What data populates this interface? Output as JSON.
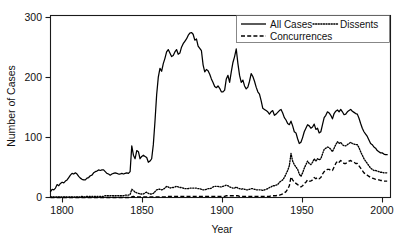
{
  "chart_data": {
    "type": "line",
    "title": "",
    "xlabel": "Year",
    "ylabel": "Number of Cases",
    "xlim": [
      1800,
      2005
    ],
    "ylim": [
      0,
      310
    ],
    "xticks": [
      1800,
      1850,
      1900,
      1950,
      2000
    ],
    "yticks": [
      0,
      100,
      200,
      300
    ],
    "grid": false,
    "legend_position": "top-right",
    "legend_entries": [
      "All Cases",
      "Dissents",
      "Concurrences"
    ],
    "x": [
      1800,
      1801,
      1802,
      1803,
      1804,
      1805,
      1806,
      1807,
      1808,
      1809,
      1810,
      1811,
      1812,
      1813,
      1814,
      1815,
      1816,
      1817,
      1818,
      1819,
      1820,
      1821,
      1822,
      1823,
      1824,
      1825,
      1826,
      1827,
      1828,
      1829,
      1830,
      1831,
      1832,
      1833,
      1834,
      1835,
      1836,
      1837,
      1838,
      1839,
      1840,
      1841,
      1842,
      1843,
      1844,
      1845,
      1846,
      1847,
      1848,
      1849,
      1850,
      1851,
      1852,
      1853,
      1854,
      1855,
      1856,
      1857,
      1858,
      1859,
      1860,
      1861,
      1862,
      1863,
      1864,
      1865,
      1866,
      1867,
      1868,
      1869,
      1870,
      1871,
      1872,
      1873,
      1874,
      1875,
      1876,
      1877,
      1878,
      1879,
      1880,
      1881,
      1882,
      1883,
      1884,
      1885,
      1886,
      1887,
      1888,
      1889,
      1890,
      1891,
      1892,
      1893,
      1894,
      1895,
      1896,
      1897,
      1898,
      1899,
      1900,
      1901,
      1902,
      1903,
      1904,
      1905,
      1906,
      1907,
      1908,
      1909,
      1910,
      1911,
      1912,
      1913,
      1914,
      1915,
      1916,
      1917,
      1918,
      1919,
      1920,
      1921,
      1922,
      1923,
      1924,
      1925,
      1926,
      1927,
      1928,
      1929,
      1930,
      1931,
      1932,
      1933,
      1934,
      1935,
      1936,
      1937,
      1938,
      1939,
      1940,
      1941,
      1942,
      1943,
      1944,
      1945,
      1946,
      1947,
      1948,
      1949,
      1950,
      1951,
      1952,
      1953,
      1954,
      1955,
      1956,
      1957,
      1958,
      1959,
      1960,
      1961,
      1962,
      1963,
      1964,
      1965,
      1966,
      1967,
      1968,
      1969,
      1970,
      1971,
      1972,
      1973,
      1974,
      1975,
      1976,
      1977,
      1978,
      1979,
      1980,
      1981,
      1982,
      1983,
      1984,
      1985,
      1986,
      1987,
      1988,
      1989,
      1990,
      1991,
      1992,
      1993,
      1994,
      1995,
      1996,
      1997,
      1998,
      1999,
      2000,
      2001,
      2002,
      2003
    ],
    "series": [
      {
        "name": "All Cases",
        "style": "solid",
        "values": [
          10,
          14,
          13,
          16,
          22,
          20,
          24,
          26,
          25,
          28,
          30,
          34,
          38,
          41,
          40,
          42,
          40,
          36,
          33,
          31,
          30,
          30,
          33,
          34,
          37,
          38,
          42,
          44,
          45,
          47,
          46,
          47,
          47,
          44,
          41,
          40,
          38,
          40,
          41,
          42,
          41,
          40,
          40,
          41,
          40,
          41,
          42,
          41,
          44,
          88,
          72,
          66,
          80,
          78,
          66,
          70,
          72,
          70,
          68,
          60,
          62,
          66,
          90,
          130,
          175,
          205,
          220,
          215,
          228,
          237,
          248,
          252,
          246,
          240,
          242,
          248,
          252,
          244,
          246,
          256,
          262,
          266,
          270,
          276,
          280,
          281,
          278,
          268,
          270,
          258,
          254,
          250,
          226,
          214,
          218,
          216,
          210,
          202,
          196,
          189,
          187,
          190,
          186,
          180,
          180,
          183,
          202,
          208,
          196,
          214,
          230,
          240,
          253,
          228,
          208,
          196,
          200,
          190,
          185,
          188,
          198,
          211,
          206,
          198,
          188,
          180,
          176,
          165,
          152,
          150,
          148,
          146,
          142,
          146,
          148,
          140,
          142,
          145,
          148,
          150,
          144,
          136,
          132,
          126,
          124,
          130,
          122,
          112,
          110,
          100,
          92,
          94,
          102,
          112,
          118,
          124,
          122,
          118,
          120,
          125,
          116,
          118,
          110,
          112,
          124,
          136,
          140,
          146,
          144,
          140,
          134,
          143,
          147,
          149,
          146,
          150,
          146,
          141,
          142,
          146,
          148,
          150,
          147,
          145,
          143,
          142,
          135,
          126,
          118,
          112,
          108,
          104,
          98,
          92,
          90,
          86,
          84,
          80,
          78,
          76,
          76,
          74,
          73,
          73
        ]
      },
      {
        "name": "Dissents",
        "style": "dotted",
        "values": [
          1,
          1,
          1,
          1,
          1,
          1,
          1,
          1,
          1,
          1,
          1,
          1,
          1,
          1,
          1,
          1,
          1,
          1,
          1,
          2,
          1,
          1,
          2,
          2,
          2,
          2,
          2,
          2,
          2,
          2,
          2,
          2,
          2,
          3,
          3,
          3,
          3,
          3,
          3,
          3,
          3,
          3,
          3,
          3,
          3,
          4,
          4,
          4,
          5,
          14,
          12,
          9,
          8,
          7,
          6,
          6,
          6,
          8,
          9,
          7,
          6,
          6,
          7,
          10,
          13,
          14,
          14,
          13,
          14,
          16,
          19,
          18,
          16,
          17,
          17,
          18,
          19,
          18,
          17,
          17,
          16,
          15,
          15,
          15,
          16,
          16,
          16,
          16,
          16,
          15,
          15,
          14,
          13,
          13,
          14,
          15,
          15,
          16,
          18,
          19,
          19,
          19,
          18,
          18,
          19,
          20,
          21,
          20,
          18,
          17,
          16,
          16,
          18,
          16,
          15,
          14,
          15,
          14,
          13,
          13,
          14,
          15,
          15,
          14,
          13,
          13,
          13,
          13,
          12,
          13,
          14,
          15,
          17,
          18,
          20,
          20,
          21,
          22,
          26,
          28,
          30,
          34,
          40,
          46,
          54,
          75,
          62,
          56,
          52,
          48,
          40,
          36,
          42,
          50,
          56,
          62,
          58,
          56,
          60,
          66,
          62,
          66,
          64,
          66,
          74,
          82,
          84,
          86,
          85,
          82,
          78,
          84,
          90,
          95,
          92,
          94,
          90,
          88,
          88,
          90,
          92,
          94,
          92,
          91,
          90,
          90,
          85,
          78,
          72,
          66,
          62,
          58,
          54,
          50,
          48,
          46,
          46,
          45,
          44,
          43,
          43,
          42,
          42,
          42
        ]
      },
      {
        "name": "Concurrences",
        "style": "dashed",
        "values": [
          0,
          0,
          0,
          0,
          0,
          0,
          0,
          0,
          0,
          0,
          0,
          0,
          0,
          0,
          0,
          0,
          0,
          0,
          0,
          0,
          0,
          0,
          0,
          0,
          0,
          0,
          0,
          0,
          0,
          0,
          0,
          0,
          0,
          0,
          0,
          0,
          0,
          0,
          0,
          0,
          0,
          0,
          0,
          0,
          0,
          0,
          0,
          0,
          0,
          1,
          2,
          1,
          1,
          1,
          1,
          1,
          1,
          1,
          1,
          1,
          1,
          1,
          1,
          1,
          1,
          1,
          1,
          1,
          1,
          1,
          2,
          2,
          2,
          2,
          2,
          2,
          2,
          2,
          2,
          2,
          2,
          2,
          2,
          2,
          2,
          2,
          2,
          2,
          2,
          2,
          2,
          2,
          2,
          2,
          2,
          2,
          2,
          2,
          2,
          2,
          2,
          2,
          2,
          2,
          2,
          2,
          3,
          3,
          3,
          3,
          3,
          3,
          3,
          3,
          2,
          2,
          2,
          2,
          2,
          2,
          2,
          2,
          2,
          2,
          2,
          2,
          2,
          2,
          2,
          2,
          2,
          2,
          2,
          3,
          3,
          3,
          3,
          4,
          4,
          5,
          6,
          8,
          10,
          14,
          20,
          35,
          30,
          26,
          24,
          22,
          20,
          18,
          20,
          24,
          26,
          30,
          28,
          28,
          30,
          34,
          32,
          34,
          32,
          34,
          40,
          44,
          46,
          48,
          48,
          46,
          46,
          52,
          58,
          62,
          60,
          63,
          60,
          58,
          58,
          60,
          62,
          63,
          61,
          60,
          58,
          58,
          54,
          50,
          46,
          42,
          40,
          38,
          36,
          34,
          33,
          32,
          31,
          30,
          30,
          29,
          29,
          28,
          28,
          28
        ]
      }
    ]
  },
  "axes": {
    "xtick_labels": [
      "1800",
      "1850",
      "1900",
      "1950",
      "2000"
    ],
    "ytick_labels": [
      "0",
      "100",
      "200",
      "300"
    ],
    "x_title": "Year",
    "y_title": "Number of Cases"
  },
  "legend": {
    "items": [
      {
        "label": "All Cases",
        "style": "solid"
      },
      {
        "label": "Dissents",
        "style": "dotted"
      },
      {
        "label": "Concurrences",
        "style": "dashed"
      }
    ]
  }
}
